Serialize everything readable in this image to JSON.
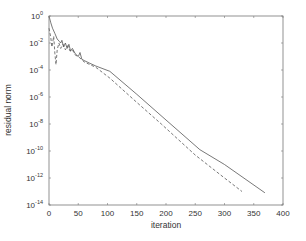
{
  "chart_data": {
    "type": "line",
    "title": "",
    "xlabel": "iteration",
    "ylabel": "residual norm",
    "xlim": [
      0,
      400
    ],
    "ylim_log10": [
      -14,
      0
    ],
    "yscale": "log",
    "grid": false,
    "legend": null,
    "x_ticks": [
      0,
      50,
      100,
      150,
      200,
      250,
      300,
      350,
      400
    ],
    "y_ticks": [
      {
        "base": "10",
        "exp": "0"
      },
      {
        "base": "10",
        "exp": "-2"
      },
      {
        "base": "10",
        "exp": "-4"
      },
      {
        "base": "10",
        "exp": "-6"
      },
      {
        "base": "10",
        "exp": "-8"
      },
      {
        "base": "10",
        "exp": "-10"
      },
      {
        "base": "10",
        "exp": "-12"
      },
      {
        "base": "10",
        "exp": "-14"
      }
    ],
    "series": [
      {
        "name": "solid",
        "style": "solid",
        "color": "#555555",
        "x": [
          0,
          3,
          6,
          10,
          14,
          18,
          20,
          22,
          25,
          28,
          31,
          34,
          37,
          40,
          45,
          50,
          53,
          56,
          60,
          70,
          80,
          104,
          150,
          200,
          258,
          300,
          369
        ],
        "log10y": [
          0.0,
          -0.5,
          -0.9,
          -1.3,
          -1.7,
          -1.9,
          -2.0,
          -1.8,
          -2.3,
          -2.0,
          -2.4,
          -2.1,
          -2.6,
          -2.4,
          -2.8,
          -3.0,
          -2.7,
          -3.2,
          -3.3,
          -3.5,
          -3.7,
          -4.1,
          -5.8,
          -7.7,
          -9.9,
          -11.0,
          -13.1
        ]
      },
      {
        "name": "dashed",
        "style": "dashed",
        "color": "#555555",
        "x": [
          0,
          3,
          5,
          8,
          10,
          12,
          14,
          17,
          20,
          24,
          28,
          32,
          36,
          40,
          45,
          50,
          55,
          60,
          70,
          80,
          104,
          150,
          192,
          250,
          300,
          330
        ],
        "log10y": [
          -0.9,
          -1.6,
          -2.3,
          -1.5,
          -2.8,
          -3.6,
          -2.5,
          -2.0,
          -2.4,
          -2.1,
          -2.5,
          -2.2,
          -2.6,
          -2.5,
          -2.9,
          -3.0,
          -3.2,
          -3.4,
          -3.6,
          -3.8,
          -4.6,
          -6.4,
          -8.0,
          -10.3,
          -12.0,
          -13.0
        ]
      }
    ]
  },
  "axes": {
    "xlabel": "iteration",
    "ylabel": "residual norm"
  }
}
